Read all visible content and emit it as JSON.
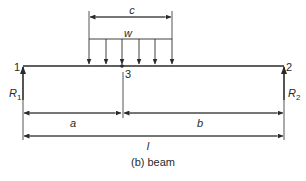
{
  "diagram": {
    "type": "simply supported beam with partial uniformly distributed load",
    "caption": "(b) beam",
    "nodes": [
      {
        "id": "1",
        "label": "1"
      },
      {
        "id": "2",
        "label": "2"
      },
      {
        "id": "3",
        "label": "3"
      }
    ],
    "reactions": [
      {
        "label": "R",
        "sub": "1",
        "at": "1"
      },
      {
        "label": "R",
        "sub": "2",
        "at": "2"
      }
    ],
    "load": {
      "label": "w",
      "span_label": "c",
      "arrow_count": 6
    },
    "dimensions": {
      "a": "a",
      "b": "b",
      "l": "l",
      "c": "c"
    },
    "colors": {
      "line": "#2a2a2a",
      "background": "#ffffff"
    }
  }
}
